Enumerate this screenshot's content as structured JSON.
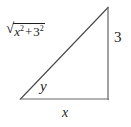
{
  "diagram": {
    "name": "right-triangle",
    "background_color": "#ffffff",
    "stroke_color": "#4a4a4a",
    "text_color": "#1e1e1e",
    "width": 131,
    "height": 127,
    "vertices": {
      "apex": [
        108,
        7
      ],
      "bottom_left": [
        20,
        99
      ],
      "bottom_right": [
        108,
        99
      ]
    },
    "sides": {
      "hypotenuse": {
        "from": "bottom_left",
        "to": "apex",
        "label_parts": {
          "radical": "√",
          "base1": "x",
          "exp1": "2",
          "operator": "+",
          "base2": "3",
          "exp2": "2"
        },
        "label_plain": "√(x² + 3²)"
      },
      "right_leg": {
        "from": "apex",
        "to": "bottom_right",
        "label": "3"
      },
      "bottom_leg": {
        "from": "bottom_left",
        "to": "bottom_right",
        "label": "x"
      }
    },
    "angle": {
      "at": "bottom_left",
      "label": "y"
    }
  }
}
